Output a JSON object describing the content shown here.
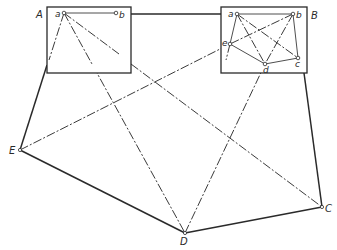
{
  "diagram": {
    "type": "network-plan",
    "nodes": {
      "A": {
        "label": "A",
        "x": 38,
        "y": 17
      },
      "B": {
        "label": "B",
        "x": 311,
        "y": 18
      },
      "C": {
        "label": "C",
        "x": 325,
        "y": 211
      },
      "D": {
        "label": "D",
        "x": 180,
        "y": 244
      },
      "E": {
        "label": "E",
        "x": 9,
        "y": 154
      }
    },
    "boxA": {
      "label": "A",
      "points": {
        "a": {
          "label": "a",
          "x": 64,
          "y": 13
        },
        "b": {
          "label": "b",
          "x": 116,
          "y": 13
        }
      }
    },
    "boxB": {
      "label": "B",
      "points": {
        "a": {
          "label": "a",
          "x": 237,
          "y": 14
        },
        "b": {
          "label": "b",
          "x": 293,
          "y": 14
        },
        "c": {
          "label": "c",
          "x": 298,
          "y": 58
        },
        "d": {
          "label": "d",
          "x": 265,
          "y": 64
        },
        "e": {
          "label": "e",
          "x": 230,
          "y": 44
        }
      }
    },
    "line_styles": {
      "solid": "outer perimeter",
      "dash-dot": "internal connections"
    }
  }
}
